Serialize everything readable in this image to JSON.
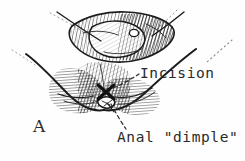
{
  "figure": {
    "panel_label": "A",
    "background_color": "#fefefe",
    "ink_color": "#1c1c1c",
    "label_color": "#2a2a2a",
    "width": 245,
    "height": 161,
    "style": "pen-and-ink hatched medical line drawing"
  },
  "labels": {
    "incision": "Incision",
    "anal_dimple": "Anal \"dimple\""
  },
  "annotations": {
    "incision_marker": "X",
    "incision_marker_x": 106,
    "incision_marker_y": 92,
    "incision_leader": "dashed leader line from X marker up-right to Incision label",
    "anal_dimple_leader": "dashed leader line from anal dimple down-right to Anal dimple label"
  },
  "drawings": {
    "upper_view": "superior view of buttock cleft with rounded hatched mass",
    "lower_view": "inferior view of perineum with anal dimple and hatched buttock contours"
  }
}
